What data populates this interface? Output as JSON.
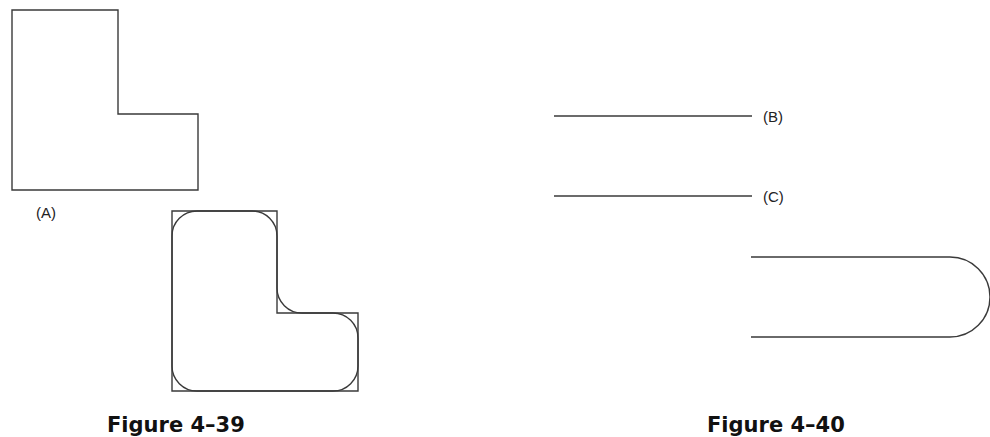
{
  "figures": [
    {
      "id": "fig-4-39",
      "caption": "Figure 4–39",
      "labels": {
        "a": "(A)"
      },
      "shapes": {
        "original_l": "L-shaped outline with sharp corners",
        "filleted_l": "L-shaped outline with rounded (filleted) corners overlaid on original"
      }
    },
    {
      "id": "fig-4-40",
      "caption": "Figure 4–40",
      "labels": {
        "b": "(B)",
        "c": "(C)"
      },
      "shapes": {
        "line_b": "horizontal line",
        "line_c": "horizontal line",
        "slot": "two parallel lines joined by semicircular arc"
      }
    }
  ],
  "colors": {
    "stroke": "#3a3a3a",
    "text": "#222222",
    "background": "#ffffff"
  }
}
